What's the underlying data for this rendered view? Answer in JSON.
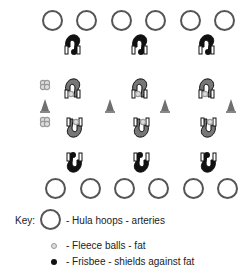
{
  "diagram": {
    "top_hoops": {
      "count": 6,
      "y": 10,
      "xs": [
        42,
        76,
        111,
        145,
        180,
        214
      ]
    },
    "bottom_hoops": {
      "count": 6,
      "y": 178,
      "xs": [
        45,
        80,
        114,
        148,
        183,
        217
      ]
    },
    "players": [
      {
        "row": "top",
        "style": "black-frisbee",
        "positions": [
          [
            62,
            33
          ],
          [
            129,
            33
          ],
          [
            196,
            33
          ]
        ]
      },
      {
        "row": "second",
        "style": "gray-fleece",
        "positions": [
          [
            62,
            77
          ],
          [
            129,
            77
          ],
          [
            196,
            77
          ]
        ]
      },
      {
        "row": "third",
        "style": "gray-fleece-inverted",
        "positions": [
          [
            65,
            117
          ],
          [
            132,
            117
          ],
          [
            199,
            117
          ]
        ]
      },
      {
        "row": "bottom",
        "style": "black-frisbee-inverted",
        "positions": [
          [
            65,
            152
          ],
          [
            132,
            152
          ],
          [
            199,
            152
          ]
        ]
      }
    ],
    "cones": [
      [
        40,
        99
      ],
      [
        105,
        99
      ],
      [
        160,
        99
      ],
      [
        226,
        99
      ]
    ],
    "fleece_clusters": [
      [
        39,
        77
      ],
      [
        39,
        114
      ]
    ]
  },
  "key": {
    "title": "Key:",
    "items": [
      {
        "symbol": "hula-hoop",
        "label": "- Hula hoops - arteries"
      },
      {
        "symbol": "fleece-ball",
        "label": "- Fleece balls - fat"
      },
      {
        "symbol": "frisbee",
        "label": "- Frisbee - shields against fat"
      }
    ]
  },
  "colors": {
    "hoop": "#555555",
    "player_dark": "#111111",
    "player_gray": "#777777",
    "fleece": "#9a9a9a",
    "cone": "#6f6f6f"
  }
}
